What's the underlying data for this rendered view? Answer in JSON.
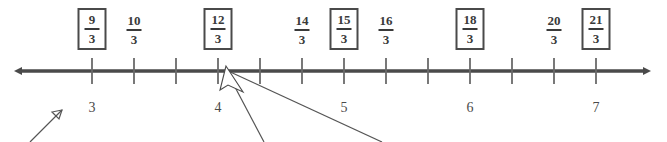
{
  "figure": {
    "type": "number-line",
    "title": "",
    "axis": {
      "orientation": "horizontal",
      "left_arrow": true,
      "right_arrow": true,
      "line_color": "#4a4a4a",
      "line_y": 71,
      "line_start_x": 14,
      "line_end_x": 653,
      "tick_start_x": 92,
      "tick_spacing": 42,
      "tick_count": 13,
      "tick_height": 26,
      "tick_color": "#6a6a6a"
    },
    "integer_labels": [
      {
        "text": "3",
        "tick_index": 0
      },
      {
        "text": "4",
        "tick_index": 3
      },
      {
        "text": "5",
        "tick_index": 6
      },
      {
        "text": "6",
        "tick_index": 9
      },
      {
        "text": "7",
        "tick_index": 12
      }
    ],
    "fractions": [
      {
        "numerator": "9",
        "denominator": "3",
        "tick_index": 0,
        "boxed": true
      },
      {
        "numerator": "10",
        "denominator": "3",
        "tick_index": 1,
        "boxed": false
      },
      {
        "numerator": "12",
        "denominator": "3",
        "tick_index": 3,
        "boxed": true
      },
      {
        "numerator": "14",
        "denominator": "3",
        "tick_index": 5,
        "boxed": false
      },
      {
        "numerator": "15",
        "denominator": "3",
        "tick_index": 6,
        "boxed": true
      },
      {
        "numerator": "16",
        "denominator": "3",
        "tick_index": 7,
        "boxed": false
      },
      {
        "numerator": "18",
        "denominator": "3",
        "tick_index": 9,
        "boxed": true
      },
      {
        "numerator": "20",
        "denominator": "3",
        "tick_index": 11,
        "boxed": false
      },
      {
        "numerator": "21",
        "denominator": "3",
        "tick_index": 12,
        "boxed": true
      }
    ],
    "annotations": {
      "color": "#555555",
      "pointer_arrow": {
        "tail_x": 30,
        "tail_y": 142,
        "tip_x": 62,
        "tip_y": 110
      },
      "leader_lines": [
        {
          "x1": 226,
          "y1": 70,
          "x2": 264,
          "y2": 142
        },
        {
          "x1": 226,
          "y1": 70,
          "x2": 382,
          "y2": 142
        }
      ],
      "cursor_marker": {
        "tip_x": 226,
        "tip_y": 66
      }
    }
  }
}
